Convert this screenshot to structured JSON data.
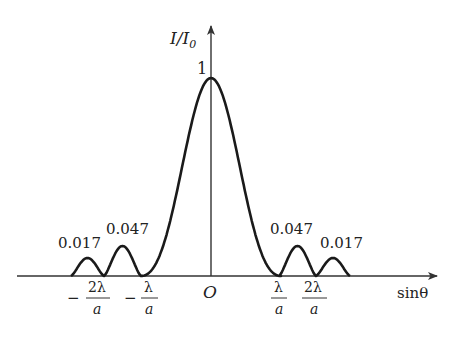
{
  "figure": {
    "type": "single-slit diffraction intensity distribution",
    "y_axis_label": {
      "main": "I/I",
      "subscript": "0"
    },
    "x_axis_label": "sinθ",
    "origin_label": "O",
    "peak_label": "1",
    "side_peak_labels": {
      "left_outer": "0.017",
      "left_inner": "0.047",
      "right_inner": "0.047",
      "right_outer": "0.017"
    },
    "x_ticks": [
      {
        "sign": "−",
        "numerator": "2λ",
        "denominator": "a"
      },
      {
        "sign": "−",
        "numerator": "λ",
        "denominator": "a"
      },
      {
        "sign": "",
        "numerator": "λ",
        "denominator": "a"
      },
      {
        "sign": "",
        "numerator": "2λ",
        "denominator": "a"
      }
    ],
    "colors": {
      "curve": "#1a1a1a",
      "axis": "#333333",
      "background": "#ffffff"
    }
  }
}
